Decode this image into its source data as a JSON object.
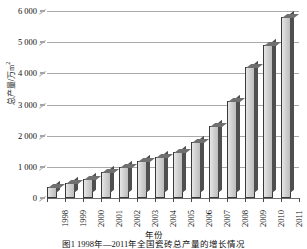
{
  "chart_data": {
    "type": "bar",
    "title": "",
    "xlabel": "年份",
    "ylabel": "总产量/万m²",
    "ylim": [
      0,
      6000
    ],
    "ytick_step": 1000,
    "ytick_labels": [
      "0",
      "1 000",
      "2 000",
      "3 000",
      "4 000",
      "5 000",
      "6 000"
    ],
    "ytick_values": [
      0,
      1000,
      2000,
      3000,
      4000,
      5000,
      6000
    ],
    "grid": true,
    "legend": "none",
    "style": "3d-column",
    "bar_color": "#d2d2d2",
    "bar_edge_color": "#3a3a3a",
    "bar_side_color": "#4f4f4f",
    "gridline_color": "#a9a9a9",
    "categories": [
      "1998",
      "1999",
      "2000",
      "2001",
      "2002",
      "2003",
      "2004",
      "2005",
      "2006",
      "2007",
      "2008",
      "2009",
      "2010",
      "2011"
    ],
    "values": [
      350,
      480,
      600,
      830,
      1000,
      1200,
      1330,
      1480,
      1810,
      2300,
      3100,
      4200,
      4900,
      5800
    ]
  },
  "axes": {
    "y_title": "总产量/万m",
    "y_title_sup": "2",
    "x_title": "年份"
  },
  "caption": {
    "text": "图1  1998年—2011年全国瓷砖总产量的增长情况"
  }
}
